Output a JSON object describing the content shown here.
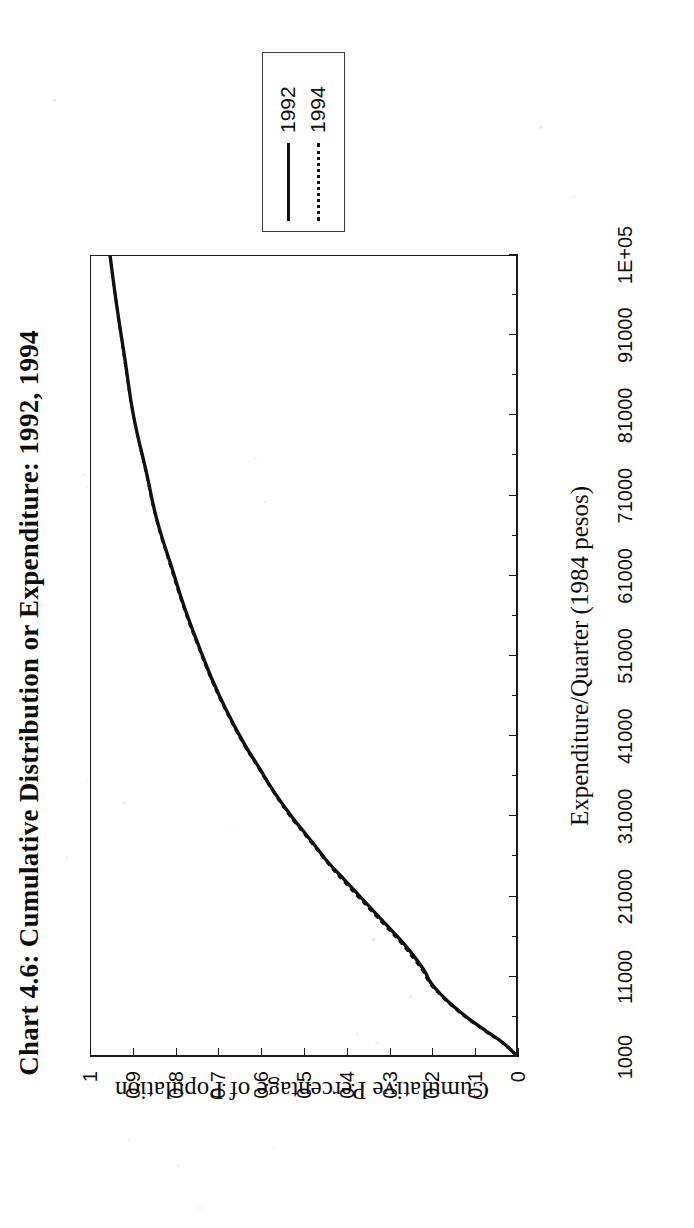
{
  "figure": {
    "title": "Chart 4.6: Cumulative Distribution or Expenditure: 1992, 1994",
    "background": "#ffffff",
    "ink": "#111111"
  },
  "legend": {
    "position": "top-right-outside",
    "entries": [
      {
        "label": "1992",
        "style": "solid",
        "icon": "solid-line-icon"
      },
      {
        "label": "1994",
        "style": "dotted",
        "icon": "dotted-line-icon"
      }
    ]
  },
  "axes": {
    "x": {
      "title": "Expenditure/Quarter (1984 pesos)",
      "tick_labels": [
        "1000",
        "11000",
        "21000",
        "31000",
        "41000",
        "51000",
        "61000",
        "71000",
        "81000",
        "91000",
        "1E+05"
      ],
      "tick_values": [
        1000,
        11000,
        21000,
        31000,
        41000,
        51000,
        61000,
        71000,
        81000,
        91000,
        101000
      ],
      "minor_ticks_between": 1,
      "lim": [
        1000,
        101000
      ]
    },
    "y": {
      "title": "Cumulative Percentage of Population",
      "tick_labels": [
        "0",
        "0.1",
        "0.2",
        "0.3",
        "0.4",
        "0.5",
        "0.6",
        "0.7",
        "0.8",
        "0.9",
        "1"
      ],
      "tick_values": [
        0,
        0.1,
        0.2,
        0.3,
        0.4,
        0.5,
        0.6,
        0.7,
        0.8,
        0.9,
        1
      ],
      "lim": [
        0,
        1
      ]
    }
  },
  "chart_data": {
    "type": "line",
    "title": "Chart 4.6: Cumulative Distribution or Expenditure: 1992, 1994",
    "xlabel": "Expenditure/Quarter (1984 pesos)",
    "ylabel": "Cumulative Percentage of Population",
    "xlim": [
      1000,
      101000
    ],
    "ylim": [
      0,
      1
    ],
    "grid": false,
    "legend_position": "top right (outside plot)",
    "x": [
      1000,
      2500,
      4000,
      5500,
      7000,
      8500,
      10000,
      11500,
      13000,
      15000,
      17000,
      19000,
      21000,
      23000,
      25000,
      27000,
      29000,
      31000,
      34000,
      37000,
      40000,
      44000,
      48000,
      52000,
      57000,
      62000,
      68000,
      74000,
      81000,
      88000,
      95000,
      101000
    ],
    "series": [
      {
        "name": "1992",
        "style": "solid",
        "values": [
          0.0,
          0.03,
          0.07,
          0.11,
          0.145,
          0.175,
          0.2,
          0.215,
          0.235,
          0.265,
          0.3,
          0.335,
          0.37,
          0.405,
          0.44,
          0.47,
          0.5,
          0.53,
          0.57,
          0.605,
          0.64,
          0.68,
          0.715,
          0.745,
          0.78,
          0.81,
          0.845,
          0.87,
          0.9,
          0.92,
          0.94,
          0.955
        ]
      },
      {
        "name": "1994",
        "style": "dotted",
        "values": [
          0.0,
          0.032,
          0.073,
          0.113,
          0.148,
          0.178,
          0.203,
          0.219,
          0.24,
          0.27,
          0.305,
          0.34,
          0.375,
          0.41,
          0.443,
          0.473,
          0.503,
          0.533,
          0.572,
          0.607,
          0.642,
          0.682,
          0.717,
          0.747,
          0.782,
          0.812,
          0.846,
          0.871,
          0.9,
          0.921,
          0.94,
          0.955
        ]
      }
    ]
  }
}
